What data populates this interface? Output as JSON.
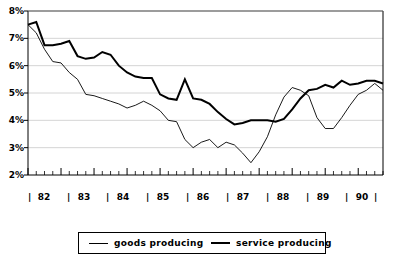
{
  "chart_data": {
    "type": "line",
    "title": "",
    "subtitle": "",
    "xlabel": "",
    "ylabel": "",
    "ylim": [
      2,
      8
    ],
    "ytick_labels": [
      "2%",
      "3%",
      "4%",
      "5%",
      "6%",
      "7%",
      "8%"
    ],
    "ytick_values": [
      2,
      3,
      4,
      5,
      6,
      7,
      8
    ],
    "xtick_labels": [
      "82",
      "83",
      "84",
      "85",
      "86",
      "87",
      "88",
      "89",
      "90"
    ],
    "x_unit": "quarter",
    "grid": "horizontal",
    "legend_position": "bottom-center",
    "legend": [
      "goods producing",
      "service producing"
    ],
    "series": [
      {
        "name": "goods producing",
        "line_style": "thin",
        "color": "#000000",
        "line_width": 0.9,
        "values": [
          7.5,
          7.2,
          6.6,
          6.15,
          6.1,
          5.75,
          5.5,
          4.95,
          4.9,
          4.8,
          4.7,
          4.6,
          4.45,
          4.55,
          4.7,
          4.55,
          4.35,
          4.0,
          3.95,
          3.3,
          3.0,
          3.2,
          3.3,
          3.0,
          3.2,
          3.1,
          2.8,
          2.45,
          2.85,
          3.4,
          4.2,
          4.85,
          5.2,
          5.1,
          4.9,
          4.1,
          3.7,
          3.7,
          4.1,
          4.55,
          4.95,
          5.1,
          5.35,
          5.1
        ]
      },
      {
        "name": "service producing",
        "line_style": "thick",
        "color": "#000000",
        "line_width": 2.0,
        "values": [
          7.5,
          7.6,
          6.75,
          6.75,
          6.8,
          6.9,
          6.35,
          6.25,
          6.3,
          6.5,
          6.4,
          6.0,
          5.75,
          5.6,
          5.55,
          5.55,
          4.95,
          4.8,
          4.75,
          5.5,
          4.8,
          4.75,
          4.6,
          4.3,
          4.05,
          3.85,
          3.9,
          4.0,
          4.0,
          4.0,
          3.95,
          4.05,
          4.4,
          4.8,
          5.1,
          5.15,
          5.3,
          5.2,
          5.45,
          5.3,
          5.35,
          5.45,
          5.45,
          5.35
        ]
      }
    ]
  },
  "axes": {
    "ytick0": "2%",
    "ytick1": "3%",
    "ytick2": "4%",
    "ytick3": "5%",
    "ytick4": "6%",
    "ytick5": "7%",
    "ytick6": "8%",
    "xtick0": "82",
    "xtick1": "83",
    "xtick2": "84",
    "xtick3": "85",
    "xtick4": "86",
    "xtick5": "87",
    "xtick6": "88",
    "xtick7": "89",
    "xtick8": "90",
    "separator": "|"
  },
  "legend": {
    "entry0": "goods producing",
    "entry1": "service producing"
  }
}
